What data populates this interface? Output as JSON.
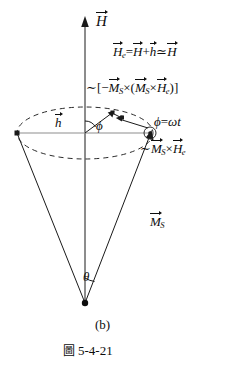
{
  "figure": {
    "caption_marker": "圖",
    "caption_number": "5-4-21",
    "panel_label": "(b)",
    "axis_label": "H",
    "equations": {
      "effective_field": {
        "lhs_symbol": "H",
        "lhs_sub": "e",
        "eq": "=",
        "term1": "H",
        "plus": "+",
        "term2": "h",
        "approx": "≃",
        "rhs": "H",
        "full_text": "H_e = H + h ≃ H"
      },
      "damping_torque": {
        "tilde": "∼",
        "open_bracket": "[",
        "minus": "−",
        "m1": "M",
        "m1_sub": "S",
        "cross1": "×",
        "open_paren": "(",
        "m2": "M",
        "m2_sub": "S",
        "cross2": "×",
        "h_sym": "H",
        "h_sub": "e",
        "close_paren": ")",
        "close_bracket": "]",
        "full_text": "∼ [−M_S × (M_S × H_e)]"
      },
      "precession_torque": {
        "tilde": "∼",
        "m": "M",
        "m_sub": "S",
        "cross": "×",
        "h_sym": "H",
        "h_sub": "e",
        "full_text": "∼ M_S × H_e"
      },
      "phase_angle": {
        "phi": "ϕ",
        "eq": "=",
        "omega": "ω",
        "t": "t",
        "full_text": "ϕ = ωt"
      }
    },
    "vector_labels": {
      "small_h": "h",
      "magnetization": "M",
      "magnetization_sub": "S"
    },
    "angle_labels": {
      "azimuthal": "ϕ",
      "polar": "θ"
    },
    "colors": {
      "ink": "#0d0d0d",
      "line": "#1a1a1a",
      "dashed": "#2b2b2b",
      "background": "#ffffff"
    }
  }
}
